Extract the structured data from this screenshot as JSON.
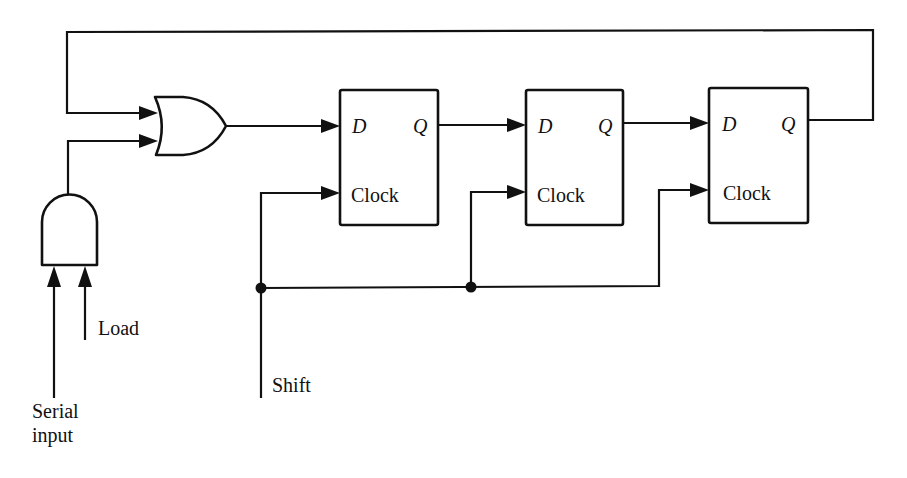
{
  "diagram": {
    "title": "",
    "type": "shift register with serial load and feedback",
    "flip_flops": [
      {
        "id": "ff1",
        "d_label": "D",
        "q_label": "Q",
        "clock_label": "Clock"
      },
      {
        "id": "ff2",
        "d_label": "D",
        "q_label": "Q",
        "clock_label": "Clock"
      },
      {
        "id": "ff3",
        "d_label": "D",
        "q_label": "Q",
        "clock_label": "Clock"
      }
    ],
    "gates": [
      {
        "id": "or-gate",
        "kind": "OR",
        "inputs": 2
      },
      {
        "id": "and-gate",
        "kind": "AND",
        "inputs": 2
      }
    ],
    "signals": {
      "serial_input": [
        "Serial",
        "input"
      ],
      "load": "Load",
      "shift": "Shift"
    },
    "connections": [
      "ff3.Q -> feedback -> or-gate.in1",
      "and-gate.out -> or-gate.in2",
      "or-gate.out -> ff1.D",
      "ff1.Q -> ff2.D",
      "ff2.Q -> ff3.D",
      "Shift -> ff1.Clock, ff2.Clock, ff3.Clock",
      "Serial input -> and-gate.in1",
      "Load -> and-gate.in2"
    ]
  }
}
